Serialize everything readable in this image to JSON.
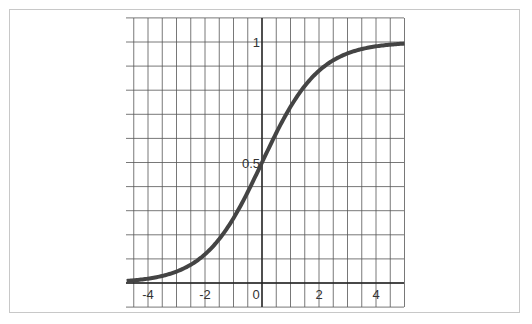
{
  "chart_data": {
    "type": "line",
    "title": "",
    "function": "logistic sigmoid 1/(1+e^-x)",
    "xlabel": "",
    "ylabel": "",
    "xlim": [
      -4.75,
      5
    ],
    "ylim": [
      0,
      1.1
    ],
    "grid": true,
    "x_grid_step": 0.5,
    "y_grid_step": 0.1,
    "x_ticks": [
      -4,
      -2,
      0,
      2,
      4
    ],
    "x_tick_labels": [
      "-4",
      "-2",
      "0",
      "2",
      "4"
    ],
    "y_ticks": [
      0.5,
      1
    ],
    "y_tick_labels": [
      "0.5",
      "1"
    ],
    "series": [
      {
        "name": "sigmoid",
        "color": "#444444",
        "x": [
          -4.75,
          -4,
          -3,
          -2,
          -1,
          0,
          1,
          2,
          3,
          4,
          5
        ],
        "y": [
          0.009,
          0.018,
          0.047,
          0.119,
          0.269,
          0.5,
          0.731,
          0.881,
          0.953,
          0.982,
          0.993
        ]
      }
    ]
  },
  "colors": {
    "grid": "#555555",
    "axis": "#222222",
    "curve": "#444444",
    "frame": "#c8c8c8"
  }
}
